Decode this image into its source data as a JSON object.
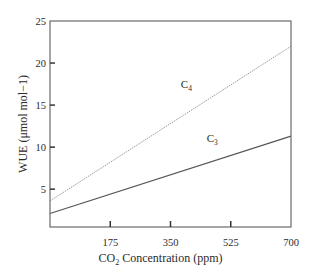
{
  "chart_data": {
    "type": "line",
    "title": "",
    "xlabel": "CO2 Concentration (ppm)",
    "xlabel_main": "CO",
    "xlabel_sub": "2",
    "xlabel_rest": " Concentration (ppm)",
    "ylabel": "WUE (μmol mol−1)",
    "xlim": [
      0,
      700
    ],
    "ylim": [
      0.5,
      25
    ],
    "xticks": [
      175,
      350,
      525,
      700
    ],
    "yticks": [
      5,
      10,
      15,
      20,
      25
    ],
    "grid": false,
    "legend": "inline labels",
    "x": [
      0,
      700
    ],
    "series": [
      {
        "name": "C4",
        "label_main": "C",
        "label_sub": "4",
        "values": [
          3.6,
          22.0
        ],
        "color": "#9a9a9a",
        "style": "dotted",
        "label_at": [
          380,
          17.0
        ]
      },
      {
        "name": "C3",
        "label_main": "C",
        "label_sub": "3",
        "values": [
          2.1,
          11.3
        ],
        "color": "#555555",
        "style": "solid",
        "label_at": [
          455,
          10.6
        ]
      }
    ]
  }
}
